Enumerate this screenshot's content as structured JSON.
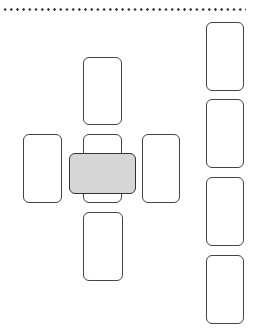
{
  "diagram": {
    "title": "",
    "header_separator": "dotted-line",
    "layout": "cross-with-side-column",
    "colors": {
      "card_border": "#444444",
      "card_fill": "#ffffff",
      "crossing_card_fill": "#d6d6d6",
      "dots": "#333333"
    },
    "cross": {
      "cards": [
        {
          "id": "top",
          "x": 83,
          "y": 57,
          "w": 39,
          "h": 68,
          "fill": "white"
        },
        {
          "id": "left",
          "x": 23,
          "y": 134,
          "w": 39,
          "h": 69,
          "fill": "white"
        },
        {
          "id": "center",
          "x": 83,
          "y": 134,
          "w": 39,
          "h": 69,
          "fill": "white"
        },
        {
          "id": "right",
          "x": 142,
          "y": 134,
          "w": 38,
          "h": 69,
          "fill": "white"
        },
        {
          "id": "bottom",
          "x": 83,
          "y": 212,
          "w": 40,
          "h": 69,
          "fill": "white"
        },
        {
          "id": "crossing",
          "x": 69,
          "y": 153,
          "w": 67,
          "h": 41,
          "fill": "gray"
        }
      ]
    },
    "staff_column": {
      "cards": [
        {
          "id": "staff-1",
          "x": 206,
          "y": 22,
          "w": 38,
          "h": 69
        },
        {
          "id": "staff-2",
          "x": 206,
          "y": 99,
          "w": 38,
          "h": 69
        },
        {
          "id": "staff-3",
          "x": 206,
          "y": 177,
          "w": 38,
          "h": 69
        },
        {
          "id": "staff-4",
          "x": 206,
          "y": 255,
          "w": 38,
          "h": 69
        }
      ]
    }
  }
}
